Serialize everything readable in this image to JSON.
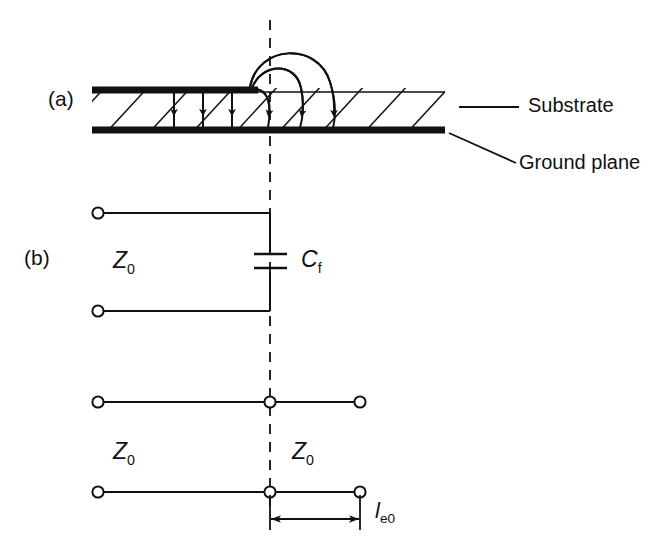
{
  "figure": {
    "type": "microstrip-open-end-equivalent-circuit",
    "parts": [
      {
        "key": "a",
        "label": "(a)"
      },
      {
        "key": "b",
        "label": "(b)"
      }
    ]
  },
  "cross_section": {
    "annotations": [
      {
        "name": "substrate",
        "label": "Substrate"
      },
      {
        "name": "ground-plane",
        "label": "Ground plane"
      }
    ],
    "field_lines": {
      "straight_count": 3,
      "fringing_count": 3
    }
  },
  "circuit_top": {
    "impedance_label": "Z",
    "impedance_sub": "0",
    "capacitor_label": "C",
    "capacitor_sub": "f"
  },
  "circuit_bottom": {
    "left_impedance_label": "Z",
    "left_impedance_sub": "0",
    "right_impedance_label": "Z",
    "right_impedance_sub": "0",
    "length_label": "l",
    "length_sub": "e0"
  },
  "colors": {
    "ink": "#111111",
    "line": "#1a1a1a",
    "background": "#ffffff"
  }
}
